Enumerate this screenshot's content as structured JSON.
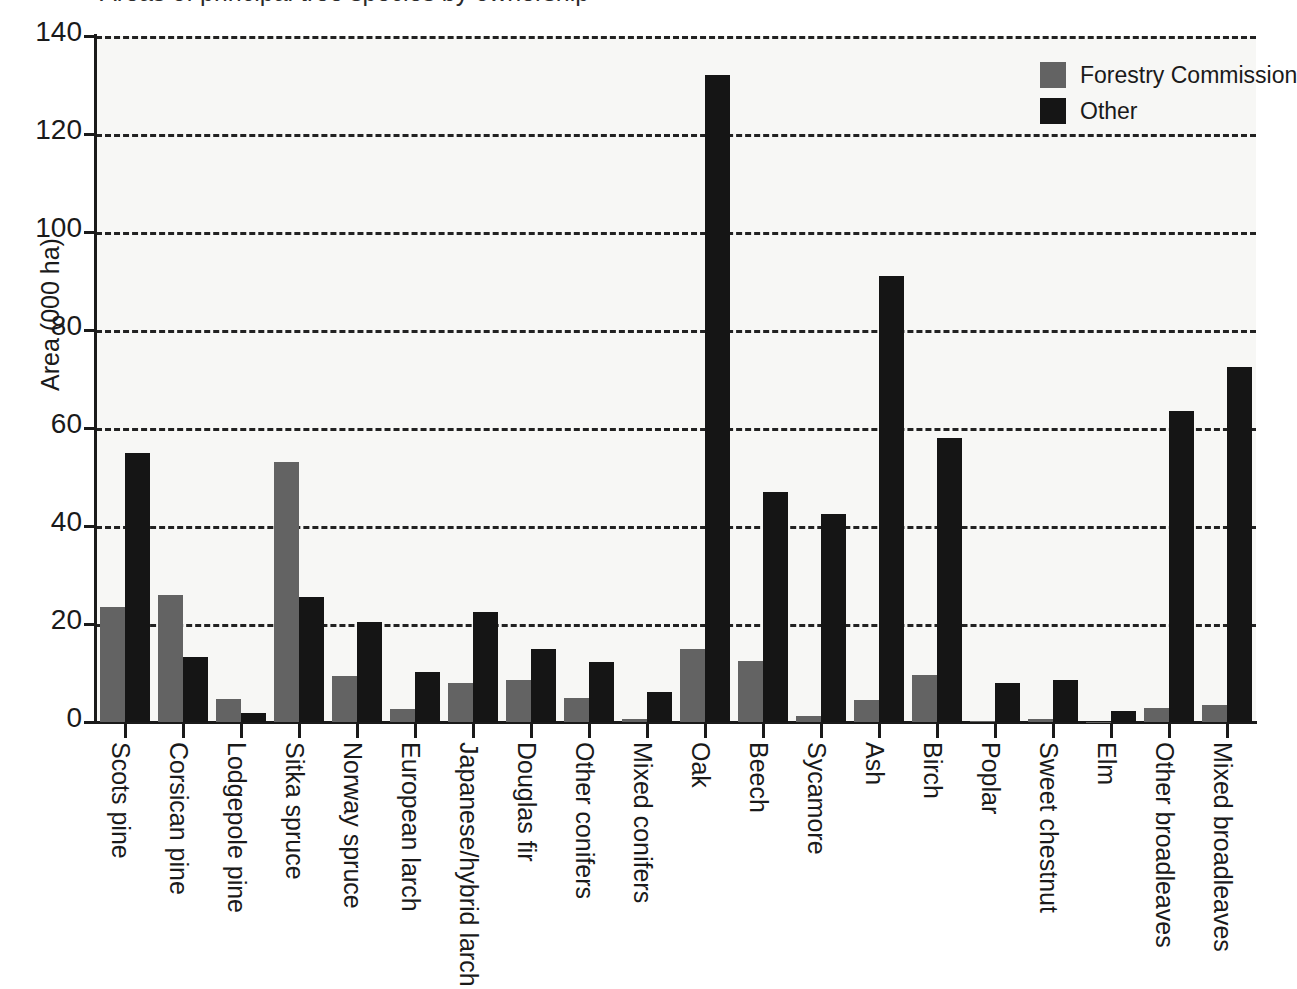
{
  "title": "Areas of principal tree species by ownership",
  "axes": {
    "ylabel": "Area (000 ha)",
    "xlabel": "",
    "yticks": [
      "0",
      "20",
      "40",
      "60",
      "80",
      "100",
      "120",
      "140"
    ]
  },
  "legend": {
    "items": [
      {
        "label": "Forestry Commission",
        "color": "#636363",
        "icon": "legend-swatch-forestry-commission"
      },
      {
        "label": "Other",
        "color": "#151515",
        "icon": "legend-swatch-other"
      }
    ]
  },
  "chart_data": {
    "type": "bar",
    "title": "Areas of principal tree species by ownership",
    "xlabel": "",
    "ylabel": "Area (000 ha)",
    "ylim": [
      0,
      140
    ],
    "ytick_step": 20,
    "grid": true,
    "legend_position": "top-right",
    "categories": [
      "Scots pine",
      "Corsican pine",
      "Lodgepole pine",
      "Sitka spruce",
      "Norway spruce",
      "European larch",
      "Japanese/hybrid larch",
      "Douglas fir",
      "Other conifers",
      "Mixed conifers",
      "Oak",
      "Beech",
      "Sycamore",
      "Ash",
      "Birch",
      "Poplar",
      "Sweet chestnut",
      "Elm",
      "Other broadleaves",
      "Mixed broadleaves"
    ],
    "series": [
      {
        "name": "Forestry Commission",
        "color": "#636363",
        "values": [
          23.5,
          26.0,
          4.7,
          53.0,
          9.3,
          2.6,
          8.0,
          8.6,
          5.0,
          0.7,
          15.0,
          12.5,
          1.3,
          4.5,
          9.6,
          0.3,
          0.7,
          0.1,
          2.8,
          3.4
        ]
      },
      {
        "name": "Other",
        "color": "#151515",
        "values": [
          55.0,
          13.3,
          1.8,
          25.5,
          20.5,
          10.2,
          22.5,
          15.0,
          12.2,
          6.2,
          132.0,
          47.0,
          42.5,
          91.0,
          58.0,
          8.0,
          8.5,
          2.2,
          63.5,
          72.5
        ]
      }
    ]
  }
}
